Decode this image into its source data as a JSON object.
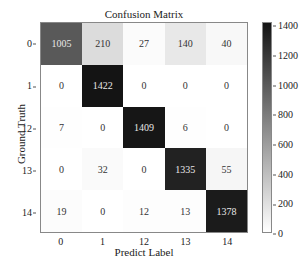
{
  "chart_data": {
    "type": "heatmap",
    "title": "Confusion Matrix",
    "xlabel": "Predict Label",
    "ylabel": "Ground Truth",
    "x_categories": [
      "0",
      "1",
      "12",
      "13",
      "14"
    ],
    "y_categories": [
      "0",
      "1",
      "12",
      "13",
      "14"
    ],
    "matrix": [
      [
        1005,
        210,
        27,
        140,
        40
      ],
      [
        0,
        1422,
        0,
        0,
        0
      ],
      [
        7,
        0,
        1409,
        6,
        0
      ],
      [
        0,
        32,
        0,
        1335,
        55
      ],
      [
        19,
        0,
        12,
        13,
        1378
      ]
    ],
    "colorbar": {
      "min": 0,
      "max": 1422,
      "ticks": [
        0,
        200,
        400,
        600,
        800,
        1000,
        1200,
        1400
      ],
      "colormap": "Greys"
    },
    "grid": false
  }
}
